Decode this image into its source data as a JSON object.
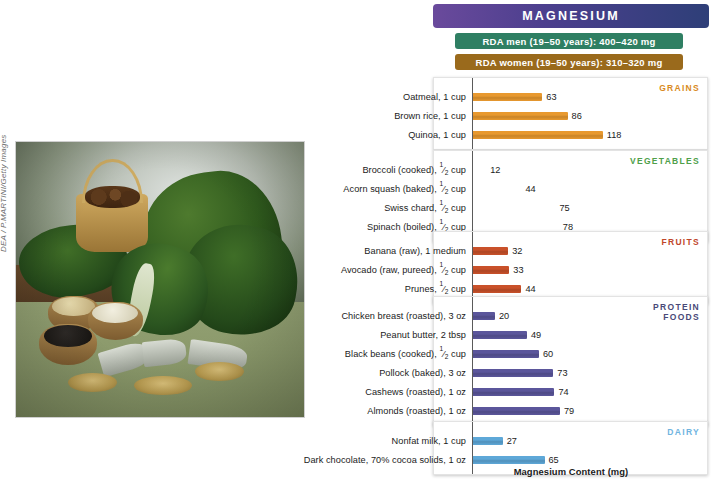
{
  "top_cut_text": "",
  "photo": {
    "credit": "DEA / P.MARTINI/Getty Images",
    "alt_name": "magnesium-rich-foods-photo"
  },
  "header": {
    "nutrient_title": "MAGNESIUM",
    "rda_men": "RDA men (19–50 years): 400–420 mg",
    "rda_women": "RDA women (19–50 years): 310–320 mg",
    "rda_men_color": "#2f7f63",
    "rda_women_color": "#9a6a1c",
    "title_color": "#4c3f8e"
  },
  "axis": {
    "caption": "Magnesium Content (mg)",
    "max_value": 130,
    "px_per_mg": 1.1
  },
  "chart_data": {
    "type": "bar",
    "orientation": "horizontal",
    "title": "MAGNESIUM",
    "xlabel": "Magnesium Content (mg)",
    "ylabel": "",
    "xlim": [
      0,
      130
    ],
    "grid": false,
    "legend": "none",
    "annotations": [
      "RDA men (19–50 years): 400–420 mg",
      "RDA women (19–50 years): 310–320 mg"
    ],
    "groups": [
      {
        "name": "GRAINS",
        "color": "#E8992F",
        "label_color": "#D98A22",
        "items": [
          {
            "label": "Oatmeal, 1 cup",
            "value": 63
          },
          {
            "label": "Brown rice, 1 cup",
            "value": 86
          },
          {
            "label": "Quinoa, 1 cup",
            "value": 118
          }
        ]
      },
      {
        "name": "VEGETABLES",
        "color": "#49A council",
        "label_color": "#4FA04A",
        "items": [
          {
            "label": "Broccoli (cooked), ½ cup",
            "value": 12
          },
          {
            "label": "Acorn squash (baked), ½ cup",
            "value": 44
          },
          {
            "label": "Swiss chard, ½ cup",
            "value": 75
          },
          {
            "label": "Spinach (boiled), ½ cup",
            "value": 78
          }
        ]
      },
      {
        "name": "FRUITS",
        "color": "#C9512A",
        "label_color": "#C0462A",
        "items": [
          {
            "label": "Banana (raw), 1 medium",
            "value": 32
          },
          {
            "label": "Avocado (raw, pureed), ½ cup",
            "value": 33
          },
          {
            "label": "Prunes, ½ cup",
            "value": 44
          }
        ]
      },
      {
        "name": "PROTEIN FOODS",
        "color": "#5B569B",
        "label_color": "#4A4A78",
        "items": [
          {
            "label": "Chicken breast (roasted), 3 oz",
            "value": 20
          },
          {
            "label": "Peanut butter, 2 tbsp",
            "value": 49
          },
          {
            "label": "Black beans (cooked), ½ cup",
            "value": 60
          },
          {
            "label": "Pollock (baked), 3 oz",
            "value": 73
          },
          {
            "label": "Cashews (roasted), 1 oz",
            "value": 74
          },
          {
            "label": "Almonds (roasted), 1 oz",
            "value": 79
          }
        ]
      },
      {
        "name": "DAIRY",
        "color": "#5EA8D8",
        "label_color": "#6FB4DF",
        "items": [
          {
            "label": "Nonfat milk, 1 cup",
            "value": 27
          },
          {
            "label": "Dark chocolate, 70% cocoa solids, 1 oz",
            "value": 65
          }
        ]
      }
    ]
  }
}
